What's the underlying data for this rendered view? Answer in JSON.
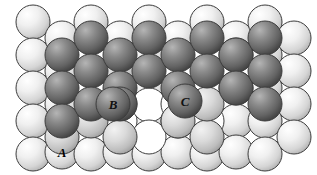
{
  "figure": {
    "name": "close-packed-lattice-stacking-diagram",
    "caption": "",
    "width": 317,
    "height": 175,
    "background": "#ffffff"
  },
  "colors": {
    "light_sphere": "#e9e9e9",
    "light_sphere_highlight": "#ffffff",
    "light_sphere_shadow": "#b8b8b8",
    "mid_sphere": "#d0d0d0",
    "dark_sphere": "#6b6b6b",
    "dark_sphere_highlight": "#a9a9a9",
    "dark_sphere_shadow": "#3a3a3a",
    "outline": "#3d3d3d",
    "hollow_fill": "#ffffff",
    "label_color": "#000000"
  },
  "geometry": {
    "sphere_radius": 17,
    "row_spacing": 33,
    "col_spacing": 29,
    "row_offset_x": 14.5
  },
  "labels": [
    {
      "id": "site-a",
      "text": "A",
      "x": 62,
      "y": 152,
      "on_dark": false
    },
    {
      "id": "site-b",
      "text": "B",
      "x": 113,
      "y": 104,
      "on_dark": true
    },
    {
      "id": "site-c",
      "text": "C",
      "x": 185,
      "y": 101,
      "on_dark": true
    }
  ],
  "layers": {
    "bottom_layer_label": "A",
    "middle_layer_label": "B",
    "top_layer_label": "C"
  },
  "spheres": {
    "light": [
      {
        "x": 33,
        "y": 22
      },
      {
        "x": 33,
        "y": 55
      },
      {
        "x": 33,
        "y": 88
      },
      {
        "x": 33,
        "y": 121
      },
      {
        "x": 33,
        "y": 154
      },
      {
        "x": 62,
        "y": 38
      },
      {
        "x": 62,
        "y": 71
      },
      {
        "x": 62,
        "y": 104
      },
      {
        "x": 62,
        "y": 152
      },
      {
        "x": 91,
        "y": 22
      },
      {
        "x": 91,
        "y": 154
      },
      {
        "x": 120,
        "y": 38
      },
      {
        "x": 120,
        "y": 152
      },
      {
        "x": 149,
        "y": 22
      },
      {
        "x": 149,
        "y": 55
      },
      {
        "x": 149,
        "y": 88
      },
      {
        "x": 149,
        "y": 121
      },
      {
        "x": 149,
        "y": 154
      },
      {
        "x": 178,
        "y": 38
      },
      {
        "x": 178,
        "y": 152
      },
      {
        "x": 207,
        "y": 22
      },
      {
        "x": 207,
        "y": 154
      },
      {
        "x": 236,
        "y": 38
      },
      {
        "x": 236,
        "y": 121
      },
      {
        "x": 236,
        "y": 152
      },
      {
        "x": 265,
        "y": 22
      },
      {
        "x": 265,
        "y": 55
      },
      {
        "x": 265,
        "y": 88
      },
      {
        "x": 265,
        "y": 121
      },
      {
        "x": 265,
        "y": 154
      },
      {
        "x": 294,
        "y": 38
      },
      {
        "x": 294,
        "y": 71
      },
      {
        "x": 294,
        "y": 104
      },
      {
        "x": 294,
        "y": 137
      }
    ],
    "mid": [
      {
        "x": 62,
        "y": 137
      },
      {
        "x": 91,
        "y": 121
      },
      {
        "x": 120,
        "y": 137
      },
      {
        "x": 178,
        "y": 121
      },
      {
        "x": 207,
        "y": 137
      },
      {
        "x": 236,
        "y": 88
      },
      {
        "x": 207,
        "y": 104
      },
      {
        "x": 236,
        "y": 55
      },
      {
        "x": 120,
        "y": 71
      }
    ],
    "dark": [
      {
        "x": 62,
        "y": 55
      },
      {
        "x": 62,
        "y": 88
      },
      {
        "x": 62,
        "y": 121
      },
      {
        "x": 91,
        "y": 38
      },
      {
        "x": 91,
        "y": 71
      },
      {
        "x": 91,
        "y": 104
      },
      {
        "x": 120,
        "y": 55
      },
      {
        "x": 120,
        "y": 88
      },
      {
        "x": 120,
        "y": 104
      },
      {
        "x": 149,
        "y": 38
      },
      {
        "x": 149,
        "y": 71
      },
      {
        "x": 178,
        "y": 55
      },
      {
        "x": 178,
        "y": 88
      },
      {
        "x": 185,
        "y": 101
      },
      {
        "x": 207,
        "y": 38
      },
      {
        "x": 207,
        "y": 71
      },
      {
        "x": 236,
        "y": 55
      },
      {
        "x": 236,
        "y": 88
      },
      {
        "x": 265,
        "y": 38
      },
      {
        "x": 265,
        "y": 71
      },
      {
        "x": 265,
        "y": 104
      },
      {
        "x": 113,
        "y": 104
      }
    ],
    "hollow": [
      {
        "x": 120,
        "y": 121
      },
      {
        "x": 149,
        "y": 105
      },
      {
        "x": 178,
        "y": 121
      },
      {
        "x": 149,
        "y": 137
      },
      {
        "x": 120,
        "y": 104
      },
      {
        "x": 178,
        "y": 104
      },
      {
        "x": 207,
        "y": 121
      }
    ]
  }
}
